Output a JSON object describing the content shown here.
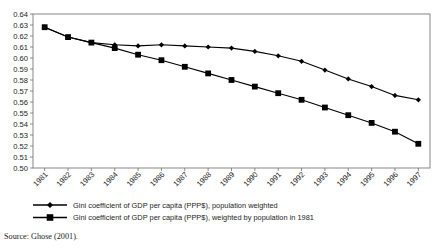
{
  "source_note": "Source: Ghose (2001).",
  "chart_data": {
    "type": "line",
    "title": "",
    "xlabel": "",
    "ylabel": "",
    "grid": false,
    "legend_position": "bottom-left",
    "ylim": [
      0.5,
      0.64
    ],
    "ytick_labels": [
      "0.64",
      "0.63",
      "0.62",
      "0.61",
      "0.60",
      "0.59",
      "0.58",
      "0.57",
      "0.56",
      "0.55",
      "0.54",
      "0.53",
      "0.52",
      "0.51",
      "0.50"
    ],
    "ytick_values": [
      0.64,
      0.63,
      0.62,
      0.61,
      0.6,
      0.59,
      0.58,
      0.57,
      0.56,
      0.55,
      0.54,
      0.53,
      0.52,
      0.51,
      0.5
    ],
    "categories": [
      "1981",
      "1982",
      "1983",
      "1984",
      "1985",
      "1986",
      "1987",
      "1988",
      "1989",
      "1990",
      "1991",
      "1992",
      "1993",
      "1994",
      "1995",
      "1996",
      "1997"
    ],
    "x": [
      1981,
      1982,
      1983,
      1984,
      1985,
      1986,
      1987,
      1988,
      1989,
      1990,
      1991,
      1992,
      1993,
      1994,
      1995,
      1996,
      1997
    ],
    "series": [
      {
        "name": "Gini coefficient of GDP per capita (PPP$), population weighted",
        "marker": "diamond",
        "color": "#000000",
        "values": [
          0.628,
          0.619,
          0.614,
          0.612,
          0.611,
          0.612,
          0.611,
          0.61,
          0.609,
          0.606,
          0.602,
          0.597,
          0.589,
          0.581,
          0.574,
          0.566,
          0.562
        ]
      },
      {
        "name": "Gini coefficient of GDP per capita (PPP$), weighted by population in 1981",
        "marker": "square",
        "color": "#000000",
        "values": [
          0.628,
          0.619,
          0.614,
          0.609,
          0.603,
          0.598,
          0.592,
          0.586,
          0.58,
          0.574,
          0.568,
          0.562,
          0.555,
          0.548,
          0.541,
          0.533,
          0.522
        ]
      }
    ]
  }
}
